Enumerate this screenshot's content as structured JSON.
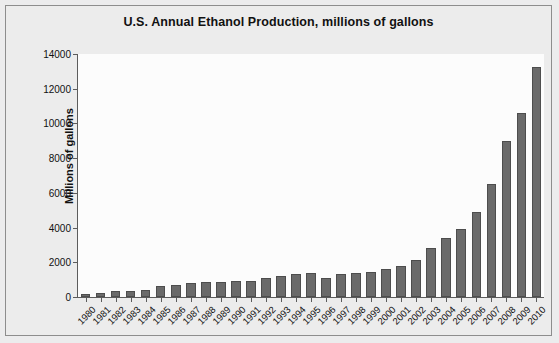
{
  "chart_data": {
    "type": "bar",
    "title": "U.S. Annual Ethanol Production, millions of gallons",
    "xlabel": "",
    "ylabel": "Millions of gallons",
    "ylim": [
      0,
      14000
    ],
    "ytick_values": [
      0,
      2000,
      4000,
      6000,
      8000,
      10000,
      12000,
      14000
    ],
    "ytick_labels": [
      "0",
      "2000",
      "4000",
      "6000",
      "8000",
      "10000",
      "12000",
      "14000"
    ],
    "grid": false,
    "legend": null,
    "bar_color": "#6a6a6a",
    "bar_edge_color": "#4d4d4d",
    "plot_background": "#fcfcfc",
    "page_background": "#ececec",
    "categories": [
      "1980",
      "1981",
      "1982",
      "1983",
      "1984",
      "1985",
      "1986",
      "1987",
      "1988",
      "1989",
      "1990",
      "1991",
      "1992",
      "1993",
      "1994",
      "1995",
      "1996",
      "1997",
      "1998",
      "1999",
      "2000",
      "2001",
      "2002",
      "2003",
      "2004",
      "2005",
      "2006",
      "2007",
      "2008",
      "2009",
      "2010"
    ],
    "values": [
      175,
      215,
      350,
      375,
      430,
      610,
      710,
      830,
      845,
      870,
      900,
      950,
      1100,
      1200,
      1350,
      1400,
      1100,
      1300,
      1400,
      1470,
      1630,
      1770,
      2130,
      2800,
      3400,
      3900,
      4900,
      6500,
      9000,
      10600,
      13230
    ]
  }
}
